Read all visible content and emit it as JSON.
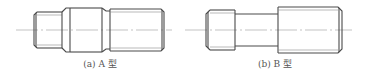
{
  "figures": [
    {
      "id": "a",
      "caption": "(a) A 型",
      "part": "stud-type-a"
    },
    {
      "id": "b",
      "caption": "(b) B 型",
      "part": "stud-type-b"
    }
  ],
  "colors": {
    "line": "#4a4a4a",
    "thin_line": "#8a8a8a",
    "center_line": "#9a9a9a",
    "background": "#ffffff"
  }
}
